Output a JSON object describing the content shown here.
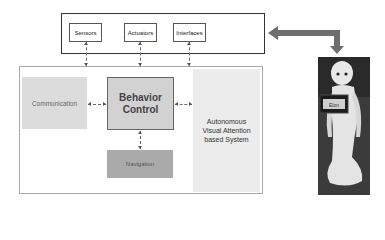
{
  "diagram": {
    "hardware_layer": {
      "items": [
        {
          "label": "Sensors"
        },
        {
          "label": "Actuators"
        },
        {
          "label": "Interfaces"
        }
      ]
    },
    "system": {
      "communication": "Communication",
      "behavior_control": {
        "line1": "Behavior",
        "line2": "Control"
      },
      "navigation": "Navigation",
      "autonomous": {
        "line1": "Autonomous",
        "line2": "Visual Attention",
        "line3": "based System"
      }
    },
    "robot_image": {
      "alt": "humanoid robot"
    },
    "colors": {
      "communication_bg": "#dcdcdc",
      "behavior_bg": "#d2d2d2",
      "navigation_bg": "#aaaaaa",
      "autonomous_bg": "#ececec",
      "big_arrow": "#6e6e6e"
    }
  }
}
